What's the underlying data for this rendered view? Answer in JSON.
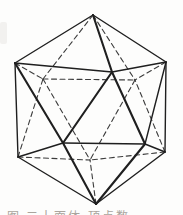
{
  "figure": {
    "name": "regular-icosahedron-wireframe",
    "background": "#fdfdfc",
    "solid_color": "#1f1f1f",
    "dashed_color": "#3c3c3c",
    "solid_width": 1.4,
    "bold_width": 2.1,
    "dashed_width": 1.1,
    "dash_pattern": "5 3.5",
    "vertices": {
      "T": [
        93,
        15
      ],
      "UL": [
        15,
        63
      ],
      "UR": [
        166,
        62
      ],
      "LL": [
        18,
        157
      ],
      "LR": [
        165,
        152
      ],
      "B": [
        96,
        204
      ],
      "F1": [
        112,
        72
      ],
      "FL": [
        63,
        143
      ],
      "FR": [
        145,
        144
      ],
      "K1": [
        43,
        79
      ],
      "K2": [
        135,
        80
      ],
      "K3": [
        90,
        160
      ]
    },
    "solid_edges": [
      [
        "T",
        "UL"
      ],
      [
        "T",
        "UR"
      ],
      [
        "T",
        "F1"
      ],
      [
        "UL",
        "LL"
      ],
      [
        "UL",
        "F1"
      ],
      [
        "UL",
        "FL"
      ],
      [
        "UR",
        "LR"
      ],
      [
        "UR",
        "F1"
      ],
      [
        "UR",
        "FR"
      ],
      [
        "F1",
        "FL"
      ],
      [
        "F1",
        "FR"
      ],
      [
        "FL",
        "FR"
      ],
      [
        "FL",
        "LL"
      ],
      [
        "FR",
        "LR"
      ],
      [
        "FL",
        "B"
      ],
      [
        "FR",
        "B"
      ],
      [
        "LL",
        "B"
      ],
      [
        "LR",
        "B"
      ]
    ],
    "bold_edges": [
      "T-F1",
      "F1-FL",
      "F1-FR",
      "UL-FL",
      "FL-B",
      "FR-B"
    ],
    "dashed_edges": [
      [
        "T",
        "K1"
      ],
      [
        "T",
        "K2"
      ],
      [
        "UL",
        "K1"
      ],
      [
        "UR",
        "K2"
      ],
      [
        "LL",
        "K1"
      ],
      [
        "LR",
        "K2"
      ],
      [
        "K1",
        "K2"
      ],
      [
        "K1",
        "K3"
      ],
      [
        "K2",
        "K3"
      ],
      [
        "LL",
        "K3"
      ],
      [
        "LR",
        "K3"
      ],
      [
        "B",
        "K3"
      ]
    ],
    "width": 183,
    "height": 215
  },
  "caption": {
    "text": "图 二十面体 顶点数"
  }
}
